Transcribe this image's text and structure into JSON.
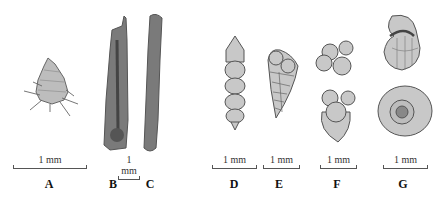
{
  "figure": {
    "panels": [
      {
        "id": "A",
        "label": "A",
        "scale": "1 mm",
        "description": "conical agglutinated test with radiating spicules"
      },
      {
        "id": "B",
        "label": "B",
        "scale": "1 mm",
        "description": "elongate tubular test, sectioned view with inner canal"
      },
      {
        "id": "C",
        "label": "C",
        "scale": "",
        "description": "elongate tubular test, external view"
      },
      {
        "id": "D",
        "label": "D",
        "scale": "1 mm",
        "description": "uniserial chambered test"
      },
      {
        "id": "E",
        "label": "E",
        "scale": "1 mm",
        "description": "biserial tapering test"
      },
      {
        "id": "F",
        "label": "F",
        "scale": "1 mm",
        "description": "trochospiral test, two views"
      },
      {
        "id": "G",
        "label": "G",
        "scale": "1 mm",
        "description": "planispiral test, two views"
      }
    ],
    "colors": {
      "specimen_fill": "#c8c8c8",
      "specimen_outline": "#555555",
      "dark_stipple": "#6a6a6a"
    }
  }
}
